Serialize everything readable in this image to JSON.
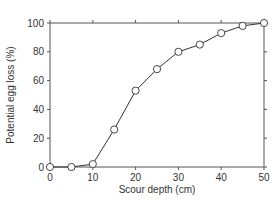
{
  "chart_data": {
    "type": "line",
    "title": "",
    "xlabel": "Scour depth (cm)",
    "ylabel": "Potential egg loss (%)",
    "x": [
      0,
      5,
      10,
      15,
      20,
      25,
      30,
      35,
      40,
      45,
      50
    ],
    "series": [
      {
        "name": "Potential egg loss",
        "values": [
          0,
          0,
          2,
          26,
          53,
          68,
          80,
          85,
          93,
          98,
          100
        ],
        "marker": "open-circle"
      }
    ],
    "xlim": [
      0,
      50
    ],
    "ylim": [
      0,
      100
    ],
    "xticks": [
      "0",
      "10",
      "20",
      "30",
      "40",
      "50"
    ],
    "yticks": [
      "0",
      "20",
      "40",
      "60",
      "80",
      "100"
    ],
    "grid": false,
    "legend": null,
    "colors": {
      "line": "#333333",
      "axis": "#555555",
      "marker_fill": "#ffffff"
    }
  }
}
